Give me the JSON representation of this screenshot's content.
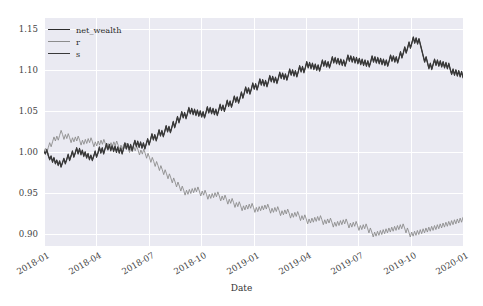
{
  "chart_data": {
    "type": "line",
    "title": "",
    "xlabel": "Date",
    "ylabel": "",
    "ylim": [
      0.885,
      1.163
    ],
    "yticks": [
      0.9,
      0.95,
      1.0,
      1.05,
      1.1,
      1.15
    ],
    "ytick_labels": [
      "0.90",
      "0.95",
      "1.00",
      "1.05",
      "1.10",
      "1.15"
    ],
    "xticks": [
      "2018-01",
      "2018-04",
      "2018-07",
      "2018-10",
      "2019-01",
      "2019-04",
      "2019-07",
      "2019-10",
      "2020-01"
    ],
    "xlim": [
      "2018-01-01",
      "2020-01-20"
    ],
    "grid": true,
    "legend_position": "upper left",
    "style": "seaborn-darkgrid",
    "background": "#eaeaf2",
    "colors": {
      "net_wealth": "#2b2b2b",
      "r": "#8c8c8c",
      "s": "#3a3a3a"
    },
    "series": [
      {
        "name": "net_wealth",
        "color": "#2b2b2b",
        "values": [
          1.0,
          0.998,
          1.003,
          0.996,
          0.991,
          0.995,
          0.988,
          0.993,
          0.986,
          0.99,
          0.984,
          0.989,
          0.982,
          0.987,
          0.992,
          0.986,
          0.991,
          0.997,
          0.99,
          0.995,
          1.001,
          0.994,
          0.999,
          1.005,
          0.998,
          1.004,
          0.997,
          1.002,
          0.995,
          1.0,
          0.993,
          0.998,
          0.991,
          0.996,
          0.99,
          0.995,
          1.001,
          0.994,
          0.999,
          1.006,
          0.999,
          1.005,
          0.998,
          1.004,
          1.01,
          1.003,
          1.009,
          1.002,
          1.008,
          1.001,
          1.007,
          1.0,
          1.006,
          0.999,
          1.005,
          0.998,
          1.004,
          1.011,
          1.004,
          1.01,
          1.003,
          1.009,
          1.002,
          1.008,
          1.014,
          1.007,
          1.013,
          1.006,
          1.012,
          1.005,
          1.011,
          1.004,
          1.01,
          1.016,
          1.009,
          1.015,
          1.022,
          1.015,
          1.021,
          1.014,
          1.02,
          1.027,
          1.02,
          1.026,
          1.019,
          1.025,
          1.032,
          1.025,
          1.031,
          1.024,
          1.03,
          1.037,
          1.03,
          1.036,
          1.043,
          1.036,
          1.042,
          1.049,
          1.042,
          1.048,
          1.041,
          1.047,
          1.054,
          1.047,
          1.053,
          1.046,
          1.052,
          1.045,
          1.051,
          1.044,
          1.05,
          1.043,
          1.049,
          1.042,
          1.048,
          1.055,
          1.048,
          1.054,
          1.047,
          1.053,
          1.046,
          1.052,
          1.045,
          1.051,
          1.058,
          1.051,
          1.057,
          1.05,
          1.056,
          1.063,
          1.056,
          1.062,
          1.055,
          1.061,
          1.068,
          1.061,
          1.067,
          1.06,
          1.066,
          1.073,
          1.066,
          1.072,
          1.079,
          1.072,
          1.078,
          1.071,
          1.077,
          1.084,
          1.077,
          1.083,
          1.076,
          1.082,
          1.089,
          1.082,
          1.088,
          1.081,
          1.087,
          1.08,
          1.086,
          1.093,
          1.086,
          1.092,
          1.085,
          1.091,
          1.084,
          1.09,
          1.097,
          1.09,
          1.096,
          1.089,
          1.095,
          1.088,
          1.094,
          1.101,
          1.094,
          1.1,
          1.093,
          1.099,
          1.092,
          1.098,
          1.105,
          1.098,
          1.104,
          1.097,
          1.103,
          1.11,
          1.103,
          1.109,
          1.102,
          1.108,
          1.101,
          1.107,
          1.1,
          1.106,
          1.099,
          1.105,
          1.112,
          1.105,
          1.111,
          1.104,
          1.11,
          1.103,
          1.109,
          1.116,
          1.109,
          1.115,
          1.108,
          1.114,
          1.107,
          1.113,
          1.106,
          1.112,
          1.105,
          1.111,
          1.118,
          1.111,
          1.117,
          1.11,
          1.116,
          1.109,
          1.115,
          1.108,
          1.114,
          1.107,
          1.113,
          1.106,
          1.112,
          1.105,
          1.111,
          1.104,
          1.11,
          1.117,
          1.11,
          1.116,
          1.109,
          1.115,
          1.108,
          1.114,
          1.107,
          1.113,
          1.106,
          1.112,
          1.105,
          1.111,
          1.118,
          1.111,
          1.117,
          1.11,
          1.116,
          1.109,
          1.115,
          1.122,
          1.115,
          1.121,
          1.128,
          1.121,
          1.127,
          1.134,
          1.127,
          1.133,
          1.14,
          1.133,
          1.139,
          1.132,
          1.138,
          1.131,
          1.124,
          1.117,
          1.11,
          1.116,
          1.109,
          1.102,
          1.108,
          1.101,
          1.107,
          1.113,
          1.106,
          1.112,
          1.105,
          1.111,
          1.104,
          1.11,
          1.103,
          1.109,
          1.102,
          1.108,
          1.101,
          1.095,
          1.101,
          1.094,
          1.1,
          1.093,
          1.099,
          1.092,
          1.098,
          1.091
        ]
      },
      {
        "name": "r",
        "color": "#8c8c8c",
        "values": [
          1.0,
          1.004,
          0.999,
          1.005,
          1.011,
          1.006,
          1.012,
          1.018,
          1.013,
          1.019,
          1.014,
          1.02,
          1.026,
          1.021,
          1.015,
          1.021,
          1.016,
          1.022,
          1.017,
          1.011,
          1.017,
          1.012,
          1.018,
          1.013,
          1.019,
          1.014,
          1.008,
          1.014,
          1.009,
          1.015,
          1.01,
          1.016,
          1.011,
          1.017,
          1.012,
          1.006,
          1.012,
          1.007,
          1.013,
          1.008,
          1.014,
          1.009,
          1.015,
          1.01,
          1.004,
          1.01,
          1.005,
          1.011,
          1.006,
          1.012,
          1.007,
          1.013,
          1.008,
          1.002,
          1.008,
          1.003,
          1.009,
          1.004,
          1.01,
          1.005,
          0.999,
          1.005,
          1.0,
          1.006,
          1.001,
          1.007,
          1.002,
          0.996,
          1.002,
          0.997,
          1.003,
          0.998,
          0.992,
          0.998,
          0.993,
          0.987,
          0.993,
          0.988,
          0.982,
          0.988,
          0.983,
          0.977,
          0.983,
          0.978,
          0.972,
          0.978,
          0.973,
          0.967,
          0.973,
          0.968,
          0.962,
          0.968,
          0.963,
          0.957,
          0.963,
          0.958,
          0.952,
          0.958,
          0.953,
          0.947,
          0.953,
          0.948,
          0.954,
          0.949,
          0.955,
          0.95,
          0.956,
          0.951,
          0.957,
          0.952,
          0.946,
          0.952,
          0.947,
          0.953,
          0.948,
          0.942,
          0.948,
          0.943,
          0.949,
          0.944,
          0.95,
          0.945,
          0.951,
          0.946,
          0.94,
          0.946,
          0.941,
          0.947,
          0.942,
          0.936,
          0.942,
          0.937,
          0.943,
          0.938,
          0.932,
          0.938,
          0.933,
          0.939,
          0.934,
          0.928,
          0.934,
          0.929,
          0.935,
          0.93,
          0.936,
          0.931,
          0.937,
          0.932,
          0.926,
          0.932,
          0.927,
          0.933,
          0.928,
          0.934,
          0.929,
          0.935,
          0.93,
          0.936,
          0.931,
          0.925,
          0.931,
          0.926,
          0.932,
          0.927,
          0.933,
          0.928,
          0.922,
          0.928,
          0.923,
          0.929,
          0.924,
          0.93,
          0.925,
          0.919,
          0.925,
          0.92,
          0.926,
          0.921,
          0.927,
          0.922,
          0.916,
          0.922,
          0.917,
          0.923,
          0.918,
          0.912,
          0.918,
          0.913,
          0.919,
          0.914,
          0.92,
          0.915,
          0.921,
          0.916,
          0.922,
          0.917,
          0.911,
          0.917,
          0.912,
          0.918,
          0.913,
          0.919,
          0.914,
          0.908,
          0.914,
          0.909,
          0.915,
          0.91,
          0.916,
          0.911,
          0.917,
          0.912,
          0.918,
          0.913,
          0.907,
          0.913,
          0.908,
          0.914,
          0.909,
          0.915,
          0.91,
          0.904,
          0.91,
          0.905,
          0.911,
          0.906,
          0.912,
          0.907,
          0.901,
          0.907,
          0.902,
          0.896,
          0.902,
          0.897,
          0.903,
          0.898,
          0.904,
          0.899,
          0.905,
          0.9,
          0.906,
          0.901,
          0.907,
          0.902,
          0.908,
          0.903,
          0.909,
          0.904,
          0.91,
          0.905,
          0.911,
          0.906,
          0.912,
          0.907,
          0.901,
          0.907,
          0.902,
          0.896,
          0.902,
          0.897,
          0.903,
          0.898,
          0.904,
          0.899,
          0.905,
          0.9,
          0.906,
          0.901,
          0.907,
          0.902,
          0.908,
          0.903,
          0.909,
          0.904,
          0.91,
          0.905,
          0.911,
          0.906,
          0.912,
          0.907,
          0.913,
          0.908,
          0.914,
          0.909,
          0.915,
          0.91,
          0.916,
          0.911,
          0.917,
          0.912,
          0.918,
          0.913,
          0.919,
          0.914,
          0.92
        ]
      },
      {
        "name": "s",
        "color": "#3a3a3a",
        "values": [
          1.0,
          0.997,
          1.002,
          0.995,
          0.99,
          0.994,
          0.987,
          0.992,
          0.985,
          0.989,
          0.983,
          0.988,
          0.981,
          0.986,
          0.991,
          0.985,
          0.99,
          0.996,
          0.989,
          0.994,
          1.0,
          0.993,
          0.998,
          1.004,
          0.997,
          1.003,
          0.996,
          1.001,
          0.994,
          0.999,
          0.992,
          0.997,
          0.99,
          0.995,
          0.989,
          0.994,
          1.0,
          0.993,
          0.998,
          1.005,
          0.998,
          1.004,
          0.997,
          1.003,
          1.009,
          1.002,
          1.008,
          1.001,
          1.007,
          1.0,
          1.006,
          0.999,
          1.005,
          0.998,
          1.004,
          0.997,
          1.003,
          1.01,
          1.003,
          1.009,
          1.002,
          1.008,
          1.001,
          1.007,
          1.013,
          1.006,
          1.012,
          1.005,
          1.011,
          1.004,
          1.01,
          1.003,
          1.009,
          1.015,
          1.008,
          1.014,
          1.021,
          1.014,
          1.02,
          1.013,
          1.019,
          1.026,
          1.019,
          1.025,
          1.018,
          1.024,
          1.031,
          1.024,
          1.03,
          1.023,
          1.029,
          1.036,
          1.029,
          1.035,
          1.042,
          1.035,
          1.041,
          1.048,
          1.041,
          1.047,
          1.04,
          1.046,
          1.053,
          1.046,
          1.052,
          1.045,
          1.051,
          1.044,
          1.05,
          1.043,
          1.049,
          1.042,
          1.048,
          1.041,
          1.047,
          1.054,
          1.047,
          1.053,
          1.046,
          1.052,
          1.045,
          1.051,
          1.044,
          1.05,
          1.057,
          1.05,
          1.056,
          1.049,
          1.055,
          1.062,
          1.055,
          1.061,
          1.054,
          1.06,
          1.067,
          1.06,
          1.066,
          1.059,
          1.065,
          1.072,
          1.065,
          1.071,
          1.078,
          1.071,
          1.077,
          1.07,
          1.076,
          1.083,
          1.076,
          1.082,
          1.075,
          1.081,
          1.088,
          1.081,
          1.087,
          1.08,
          1.086,
          1.079,
          1.085,
          1.092,
          1.085,
          1.091,
          1.084,
          1.09,
          1.083,
          1.089,
          1.096,
          1.089,
          1.095,
          1.088,
          1.094,
          1.087,
          1.093,
          1.1,
          1.093,
          1.099,
          1.092,
          1.098,
          1.091,
          1.097,
          1.104,
          1.097,
          1.103,
          1.096,
          1.102,
          1.109,
          1.102,
          1.108,
          1.101,
          1.107,
          1.1,
          1.106,
          1.099,
          1.105,
          1.098,
          1.104,
          1.111,
          1.104,
          1.11,
          1.103,
          1.109,
          1.102,
          1.108,
          1.115,
          1.108,
          1.114,
          1.107,
          1.113,
          1.106,
          1.112,
          1.105,
          1.111,
          1.104,
          1.11,
          1.117,
          1.11,
          1.116,
          1.109,
          1.115,
          1.108,
          1.114,
          1.107,
          1.113,
          1.106,
          1.112,
          1.105,
          1.111,
          1.104,
          1.11,
          1.103,
          1.109,
          1.116,
          1.109,
          1.115,
          1.108,
          1.114,
          1.107,
          1.113,
          1.106,
          1.112,
          1.105,
          1.111,
          1.104,
          1.11,
          1.117,
          1.11,
          1.116,
          1.109,
          1.115,
          1.108,
          1.114,
          1.121,
          1.114,
          1.12,
          1.127,
          1.12,
          1.126,
          1.133,
          1.126,
          1.132,
          1.139,
          1.132,
          1.138,
          1.131,
          1.137,
          1.13,
          1.123,
          1.116,
          1.109,
          1.115,
          1.108,
          1.101,
          1.107,
          1.1,
          1.106,
          1.112,
          1.105,
          1.111,
          1.104,
          1.11,
          1.103,
          1.109,
          1.102,
          1.108,
          1.101,
          1.107,
          1.1,
          1.094,
          1.1,
          1.093,
          1.099,
          1.092,
          1.098,
          1.091,
          1.097,
          1.09
        ]
      }
    ]
  },
  "legend": {
    "entries": [
      {
        "label": "net_wealth",
        "color": "#2b2b2b"
      },
      {
        "label": "r",
        "color": "#8c8c8c"
      },
      {
        "label": "s",
        "color": "#3a3a3a"
      }
    ]
  },
  "axis": {
    "x_title": "Date"
  }
}
